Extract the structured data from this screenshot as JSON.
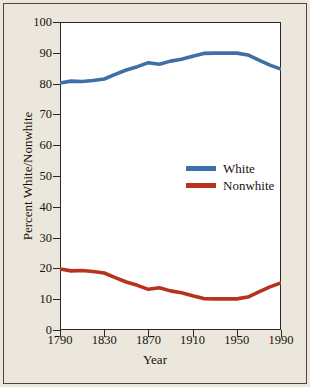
{
  "chart_data": {
    "type": "line",
    "title": "",
    "xlabel": "Year",
    "ylabel": "Percent White/Nonwhite",
    "xlim": [
      1790,
      1990
    ],
    "ylim": [
      0,
      100
    ],
    "grid": false,
    "legend_position": "center-right inside axes",
    "xticks": [
      1790,
      1830,
      1870,
      1910,
      1950,
      1990
    ],
    "xtick_labels": [
      "1790",
      "1830",
      "1870",
      "1910",
      "1950",
      "1990"
    ],
    "yticks": [
      0,
      10,
      20,
      30,
      40,
      50,
      60,
      70,
      80,
      90,
      100
    ],
    "ytick_labels": [
      "0",
      "10",
      "20",
      "30",
      "40",
      "50",
      "60",
      "70",
      "80",
      "90",
      "100"
    ],
    "x": [
      1790,
      1800,
      1810,
      1820,
      1830,
      1840,
      1850,
      1860,
      1870,
      1880,
      1890,
      1900,
      1910,
      1920,
      1930,
      1940,
      1950,
      1960,
      1970,
      1980,
      1990
    ],
    "series": [
      {
        "name": "White",
        "color": "#3f6fa8",
        "values": [
          80.2,
          80.8,
          80.7,
          81.0,
          81.5,
          83.0,
          84.4,
          85.5,
          86.8,
          86.3,
          87.3,
          87.9,
          88.9,
          89.8,
          89.9,
          89.9,
          89.9,
          89.3,
          87.6,
          86.0,
          84.7
        ]
      },
      {
        "name": "Nonwhite",
        "color": "#b8331d",
        "values": [
          19.8,
          19.2,
          19.3,
          19.0,
          18.5,
          17.0,
          15.6,
          14.5,
          13.2,
          13.7,
          12.7,
          12.1,
          11.1,
          10.2,
          10.1,
          10.1,
          10.1,
          10.7,
          12.4,
          14.0,
          15.3
        ]
      }
    ],
    "colors": {
      "white_series": "#3f6fa8",
      "nonwhite_series": "#b8331d",
      "plot_background": "#ffffff",
      "figure_background": "#ece7dc",
      "axis": "#2a2723",
      "text": "#16130f"
    }
  },
  "legend": {
    "entries": [
      {
        "label": "White",
        "color": "#3f6fa8"
      },
      {
        "label": "Nonwhite",
        "color": "#b8331d"
      }
    ]
  }
}
